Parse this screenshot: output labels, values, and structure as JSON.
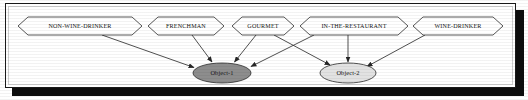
{
  "figure": {
    "title_text": "",
    "frame": {
      "border_color": "#1a1a1a",
      "shadow_color": "#0d0d0d",
      "background": "#ffffff"
    }
  },
  "nodes": {
    "attributes": [
      {
        "id": "non-wine-drinker",
        "label": "NON-WINE-DRINKER",
        "shape": "hexagon",
        "fill": "#ffffff",
        "cx": 74,
        "cy": 22,
        "rx": 62,
        "ry": 9
      },
      {
        "id": "frenchman",
        "label": "FRENCHMAN",
        "shape": "hexagon",
        "fill": "#ffffff",
        "cx": 180,
        "cy": 22,
        "rx": 38,
        "ry": 9
      },
      {
        "id": "gourmet",
        "label": "GOURMET",
        "shape": "hexagon",
        "fill": "#ffffff",
        "cx": 257,
        "cy": 22,
        "rx": 31,
        "ry": 9
      },
      {
        "id": "in-the-restaurant",
        "label": "IN-THE-RESTAURANT",
        "shape": "hexagon",
        "fill": "#ffffff",
        "cx": 348,
        "cy": 22,
        "rx": 54,
        "ry": 9
      },
      {
        "id": "wine-drinker",
        "label": "WINE-DRINKER",
        "shape": "hexagon",
        "fill": "#ffffff",
        "cx": 452,
        "cy": 22,
        "rx": 45,
        "ry": 9
      }
    ],
    "objects": [
      {
        "id": "object-1",
        "label": "Object-1",
        "shape": "ellipse",
        "fill": "#8d8d8d",
        "cx": 216,
        "cy": 69,
        "rx": 29,
        "ry": 10
      },
      {
        "id": "object-2",
        "label": "Object-2",
        "shape": "ellipse",
        "fill": "#e2e2e2",
        "cx": 342,
        "cy": 69,
        "rx": 28,
        "ry": 10
      }
    ]
  },
  "edges": [
    {
      "from": "non-wine-drinker",
      "to": "object-1",
      "x1": 96,
      "y1": 31,
      "x2": 189,
      "y2": 64
    },
    {
      "from": "frenchman",
      "to": "object-1",
      "x1": 186,
      "y1": 31,
      "x2": 207,
      "y2": 58
    },
    {
      "from": "gourmet",
      "to": "object-1",
      "x1": 250,
      "y1": 31,
      "x2": 228,
      "y2": 58
    },
    {
      "from": "gourmet",
      "to": "object-2",
      "x1": 268,
      "y1": 31,
      "x2": 327,
      "y2": 60
    },
    {
      "from": "in-the-restaurant",
      "to": "object-1",
      "x1": 310,
      "y1": 31,
      "x2": 245,
      "y2": 62
    },
    {
      "from": "in-the-restaurant",
      "to": "object-2",
      "x1": 342,
      "y1": 31,
      "x2": 342,
      "y2": 58
    },
    {
      "from": "wine-drinker",
      "to": "object-2",
      "x1": 420,
      "y1": 31,
      "x2": 362,
      "y2": 62
    }
  ],
  "legend": {
    "attribute_shape_name": "hexagon",
    "object_shape_name": "ellipse"
  }
}
